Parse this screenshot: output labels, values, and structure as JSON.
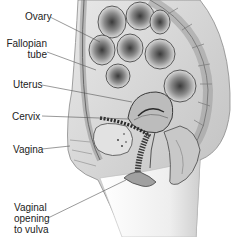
{
  "diagram": {
    "labels": [
      {
        "id": "ovary",
        "text": "Ovary"
      },
      {
        "id": "fallopian-tube",
        "text": "Fallopian\ntube"
      },
      {
        "id": "uterus",
        "text": "Uterus"
      },
      {
        "id": "cervix",
        "text": "Cervix"
      },
      {
        "id": "vagina",
        "text": "Vagina"
      },
      {
        "id": "vaginal-opening",
        "text": "Vaginal\nopening\nto vulva"
      }
    ],
    "colors": {
      "background": "#ffffff",
      "label_text": "#222222",
      "leader_line": "#555555",
      "tissue_light": "#d9d9d9",
      "tissue_mid": "#a8a8a8",
      "tissue_dark": "#4a4a4a"
    }
  }
}
